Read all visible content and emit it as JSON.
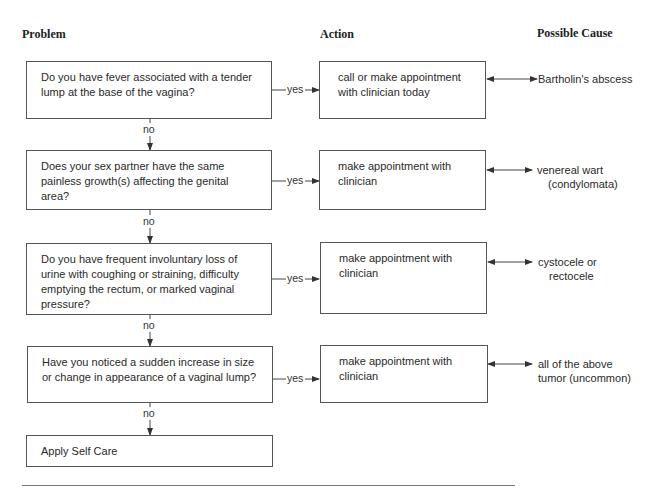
{
  "headers": {
    "problem": "Problem",
    "action": "Action",
    "cause": "Possible Cause"
  },
  "rows": [
    {
      "question": "Do you have fever associated with a tender lump at the base of the vagina?",
      "yes_label": "yes",
      "no_label": "no",
      "action": "call or make appointment with clinician today",
      "cause_line1": "Bartholin's abscess",
      "cause_line2": ""
    },
    {
      "question": "Does your sex partner have the same painless growth(s) affecting the genital area?",
      "yes_label": "yes",
      "no_label": "no",
      "action": "make appointment with clinician",
      "cause_line1": "venereal wart",
      "cause_line2": "(condylomata)"
    },
    {
      "question": "Do you have frequent involuntary loss of urine with coughing or straining, difficulty emptying the rectum, or marked vaginal pressure?",
      "yes_label": "yes",
      "no_label": "no",
      "action": "make appointment with clinician",
      "cause_line1": "cystocele or",
      "cause_line2": "rectocele"
    },
    {
      "question": "Have you noticed a sudden increase in size or change in appearance of a vaginal lump?",
      "yes_label": "yes",
      "no_label": "no",
      "action": "make appointment with clinician",
      "cause_line1": "all of the above",
      "cause_line2": "tumor (uncommon)"
    }
  ],
  "final": {
    "label": "Apply Self Care"
  }
}
